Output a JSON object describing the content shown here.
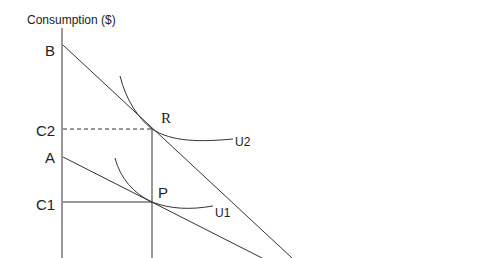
{
  "diagram": {
    "y_axis_label": "Consumption ($)",
    "tick_labels": {
      "B": "B",
      "C2": "C2",
      "A": "A",
      "C1": "C1"
    },
    "points": {
      "R": "R",
      "P": "P"
    },
    "curves": {
      "U2": "U2",
      "U1": "U1"
    },
    "colors": {
      "line": "#333333",
      "background": "#ffffff"
    }
  }
}
